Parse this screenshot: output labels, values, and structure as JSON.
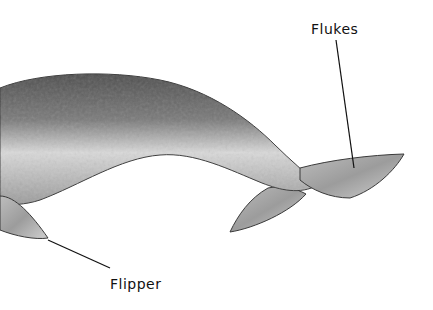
{
  "diagram": {
    "labels": [
      {
        "id": "flukes",
        "text": "Flukes"
      },
      {
        "id": "flipper",
        "text": "Flipper"
      }
    ],
    "colors": {
      "background": "#ffffff",
      "body_dark": "#5a5a5a",
      "body_light": "#e6e6e6",
      "outline": "#333333",
      "leader_line": "#111111"
    }
  }
}
